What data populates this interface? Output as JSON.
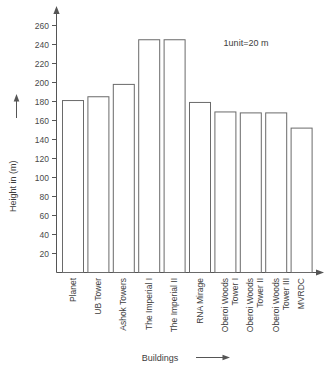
{
  "chart_data": {
    "type": "bar",
    "title": "",
    "xlabel": "Buildings",
    "ylabel": "Height in (m)",
    "ylim": [
      0,
      270
    ],
    "ytick_values": [
      20,
      40,
      60,
      80,
      100,
      120,
      140,
      160,
      180,
      200,
      220,
      240,
      260
    ],
    "ytick_labels": [
      "20",
      "40",
      "60",
      "80",
      "100",
      "120",
      "140",
      "160",
      "180",
      "200",
      "220",
      "240",
      "260"
    ],
    "grid": false,
    "legend": null,
    "annotation": "1unit=20 m",
    "categories": [
      "Planet",
      "UB Tower",
      "Ashok Towers",
      "The Imperial I",
      "The Imperial II",
      "RNA Mirage",
      "Oberoi Woods Tower I",
      "Oberoi Woods Tower II",
      "Oberoi Woods Tower III",
      "MVRDC"
    ],
    "values": [
      181,
      185,
      198,
      245,
      245,
      179,
      169,
      168,
      168,
      152
    ],
    "bars": [
      {
        "label": "Planet",
        "value": 181
      },
      {
        "label": "UB Tower",
        "value": 185
      },
      {
        "label": "Ashok Towers",
        "value": 198
      },
      {
        "label": "The Imperial I",
        "value": 245
      },
      {
        "label": "The Imperial II",
        "value": 245
      },
      {
        "label": "RNA Mirage",
        "value": 179
      },
      {
        "label": "Oberoi Woods Tower I",
        "value": 169
      },
      {
        "label": "Oberoi Woods Tower II",
        "value": 168
      },
      {
        "label": "Oberoi Woods Tower III",
        "value": 168
      },
      {
        "label": "MVRDC",
        "value": 152
      }
    ],
    "colors": {
      "bar_fill": "#ffffff",
      "bar_stroke": "#6a6a6a",
      "axis": "#555555",
      "text": "#3d3d3d",
      "background": "#ffffff"
    }
  }
}
